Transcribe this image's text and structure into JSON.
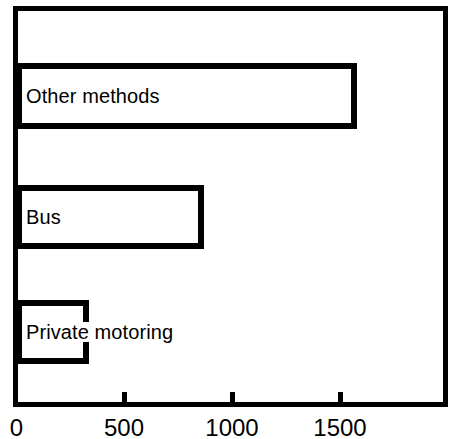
{
  "chart_data": {
    "type": "bar",
    "orientation": "horizontal",
    "title": "",
    "subtitle": "",
    "xlabel": "",
    "ylabel": "",
    "categories": [
      "Other methods",
      "Bus",
      "Private motoring"
    ],
    "values": [
      1580,
      870,
      340
    ],
    "series": [
      {
        "name": "",
        "values": [
          1580,
          870,
          340
        ]
      }
    ],
    "xlim": [
      0,
      2000
    ],
    "ylim": null,
    "xticks": [
      0,
      500,
      1000,
      1500
    ],
    "xtick_labels": [
      "0",
      "500",
      "1000",
      "1500"
    ],
    "yticks": [],
    "ytick_labels": [],
    "grid": false,
    "legend": false,
    "legend_position": "none",
    "annotations": [],
    "bar_fill_color": "#ffffff",
    "bar_edge_color": "#000000",
    "frame_color": "#000000",
    "background_color": "#ffffff",
    "bar_labels_inside": true,
    "bars": [
      {
        "label": "Other methods",
        "value": 1580
      },
      {
        "label": "Bus",
        "value": 870
      },
      {
        "label": "Private motoring",
        "value": 340
      }
    ]
  },
  "axis": {
    "tick_0": "0",
    "tick_500": "500",
    "tick_1000": "1000",
    "tick_1500": "1500"
  },
  "labels": {
    "other_methods": "Other methods",
    "bus": "Bus",
    "private_motoring": "Private motoring"
  }
}
